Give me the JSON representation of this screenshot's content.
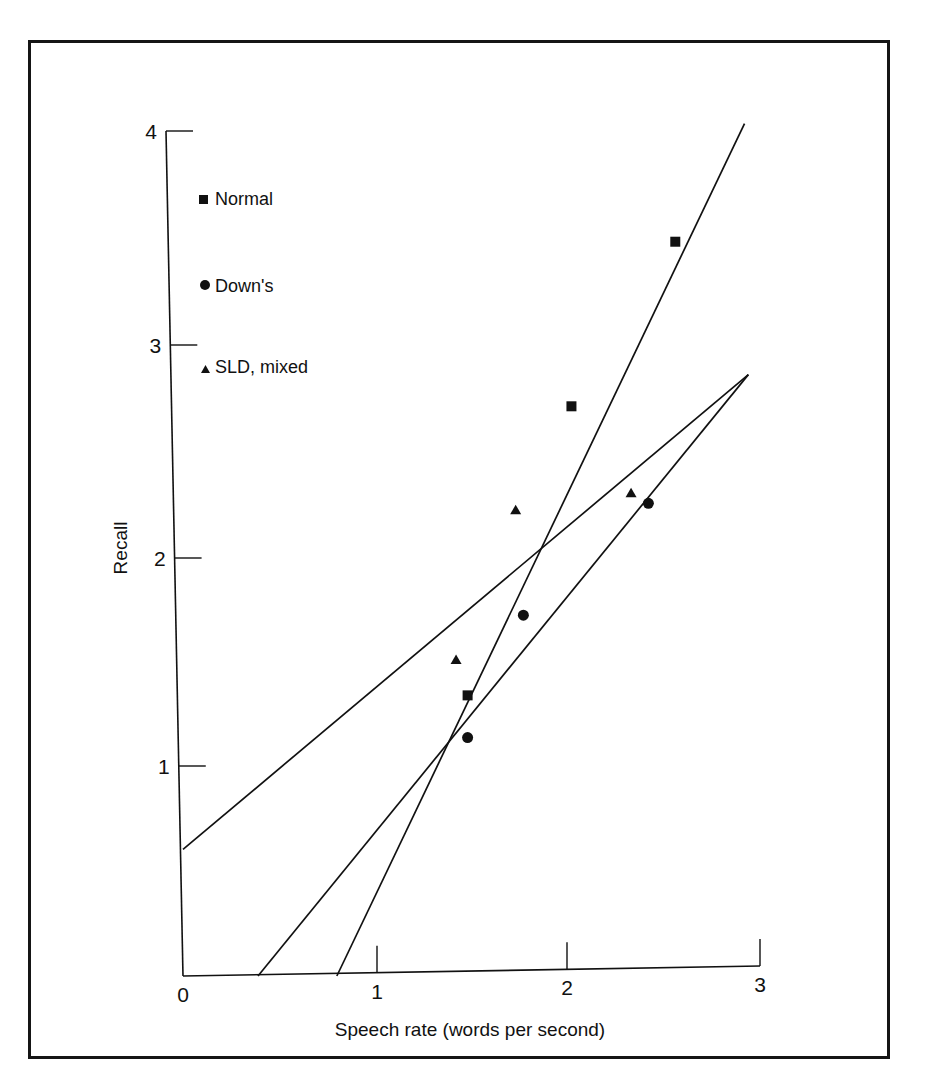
{
  "chart_data": {
    "type": "scatter",
    "title": "",
    "xlabel": "Speech rate (words per second)",
    "ylabel": "Recall",
    "xlim": [
      0,
      3
    ],
    "ylim": [
      0,
      4
    ],
    "xticks": [
      "0",
      "1",
      "2",
      "3"
    ],
    "yticks": [
      "1",
      "2",
      "3",
      "4"
    ],
    "grid": false,
    "legend_position": "upper-left",
    "series": [
      {
        "name": "Normal",
        "marker": "square",
        "points": [
          {
            "x": 2.56,
            "y": 3.48
          },
          {
            "x": 2.02,
            "y": 2.7
          },
          {
            "x": 1.48,
            "y": 1.33
          }
        ],
        "fit_line": {
          "x1": 0.8,
          "y1": 0.0,
          "x2": 2.92,
          "y2": 4.04
        }
      },
      {
        "name": "Down's",
        "marker": "circle",
        "points": [
          {
            "x": 2.42,
            "y": 2.24
          },
          {
            "x": 1.77,
            "y": 1.71
          },
          {
            "x": 1.48,
            "y": 1.13
          }
        ],
        "fit_line": {
          "x1": 0.0,
          "y1": 0.6,
          "x2": 2.94,
          "y2": 2.85
        }
      },
      {
        "name": "SLD, mixed",
        "marker": "triangle",
        "points": [
          {
            "x": 2.33,
            "y": 2.29
          },
          {
            "x": 1.73,
            "y": 2.21
          },
          {
            "x": 1.42,
            "y": 1.5
          }
        ],
        "fit_line": {
          "x1": 0.39,
          "y1": 0.0,
          "x2": 2.94,
          "y2": 2.85
        }
      }
    ]
  },
  "legend": {
    "items": [
      {
        "label": "Normal",
        "marker": "square"
      },
      {
        "label": "Down's",
        "marker": "circle"
      },
      {
        "label": "SLD, mixed",
        "marker": "triangle"
      }
    ]
  },
  "colors": {
    "ink": "#111111",
    "background": "#ffffff"
  }
}
